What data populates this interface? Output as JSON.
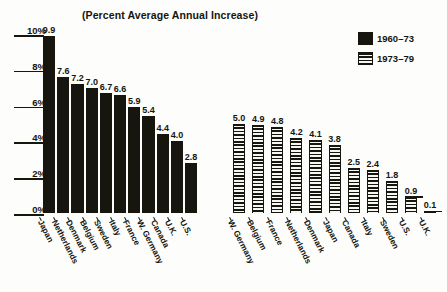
{
  "chart_data": {
    "type": "bar",
    "title": "(Percent Average Annual Increase)",
    "xlabel": "",
    "ylabel": "",
    "ylim": [
      0,
      10
    ],
    "ytick_labels": [
      "0%",
      "2%",
      "4%",
      "6%",
      "8%",
      "10%"
    ],
    "ytick_values": [
      0,
      2,
      4,
      6,
      8,
      10
    ],
    "grid": false,
    "legend_position": "top-right",
    "legend": [
      "1960–73",
      "1973–79"
    ],
    "groups": [
      {
        "series_name": "1960–73",
        "pattern": "solid",
        "categories": [
          "Japan",
          "Netherlands",
          "Denmark",
          "Belgium",
          "Sweden",
          "Italy",
          "France",
          "W. Germany",
          "Canada",
          "U.K.",
          "U.S."
        ],
        "values": [
          9.9,
          7.6,
          7.2,
          7.0,
          6.7,
          6.6,
          5.9,
          5.4,
          4.4,
          4.0,
          2.8
        ],
        "value_labels": [
          "9.9",
          "7.6",
          "7.2",
          "7.0",
          "6.7",
          "6.6",
          "5.9",
          "5.4",
          "4.4",
          "4.0",
          "2.8"
        ]
      },
      {
        "series_name": "1973–79",
        "pattern": "striped",
        "categories": [
          "W. Germany",
          "Belgium",
          "France",
          "Netherlands",
          "Denmark",
          "Japan",
          "Canada",
          "Italy",
          "Sweden",
          "U.S.",
          "U.K."
        ],
        "values": [
          5.0,
          4.9,
          4.8,
          4.2,
          4.1,
          3.8,
          2.5,
          2.4,
          1.8,
          0.9,
          0.1
        ],
        "value_labels": [
          "5.0",
          "4.9",
          "4.8",
          "4.2",
          "4.1",
          "3.8",
          "2.5",
          "2.4",
          "1.8",
          "0.9",
          "0.1"
        ]
      }
    ],
    "colors": {
      "bar_solid": "#16160f",
      "bar_stripe": "#16160f",
      "background": "#fdfdfb",
      "text": "#15150f"
    }
  }
}
